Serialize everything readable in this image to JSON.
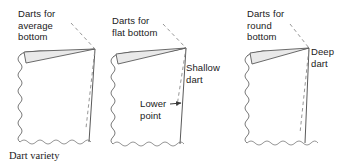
{
  "figure": {
    "caption": "Dart variety",
    "type": "sewing-pattern-diagram",
    "panel_count": 3,
    "colors": {
      "line": "#5a5a5a",
      "dart_fill": "#e8e8e8",
      "text": "#1a1a1a",
      "background": "#ffffff"
    }
  },
  "panels": [
    {
      "id": "average",
      "title": "Darts for\naverage\nbottom",
      "dart_depth": "medium",
      "annotations": []
    },
    {
      "id": "flat",
      "title": "Darts for\nflat bottom",
      "dart_depth": "shallow",
      "annotations": [
        {
          "id": "shallow-dart",
          "text": "Shallow\ndart",
          "arrow": false
        },
        {
          "id": "lower-point",
          "text": "Lower\npoint",
          "arrow": true,
          "arrow_direction": "right"
        }
      ]
    },
    {
      "id": "round",
      "title": "Darts for\nround\nbottom",
      "dart_depth": "deep",
      "annotations": [
        {
          "id": "deep-dart",
          "text": "Deep\ndart",
          "arrow": false
        }
      ]
    }
  ],
  "labels": {
    "average_bottom": "Darts for\naverage\nbottom",
    "flat_bottom": "Darts for\nflat bottom",
    "round_bottom": "Darts for\nround\nbottom",
    "shallow_dart": "Shallow\ndart",
    "lower_point": "Lower\npoint",
    "deep_dart": "Deep\ndart",
    "caption": "Dart variety"
  }
}
